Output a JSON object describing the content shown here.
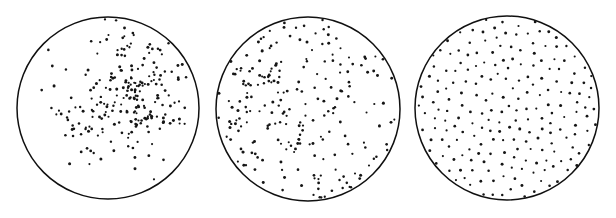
{
  "figure": {
    "width": 616,
    "height": 218,
    "background_color": "#ffffff",
    "ink_color": "#151515",
    "circle_stroke_color": "#101010",
    "circle_stroke_width": 1.5,
    "dot_color": "#151515",
    "dot_radius": 1.25,
    "panel_count": 3
  },
  "chart_data": {
    "type": "scatter",
    "title": "",
    "subtitle": "",
    "xlabel": "",
    "ylabel": "",
    "grid": false,
    "legend": "none",
    "axes_visible": false,
    "window_shape": "circle",
    "panels": [
      {
        "index": 0,
        "name": "clustered",
        "label": "",
        "center_x": 108,
        "center_y": 108,
        "radius": 91,
        "n_points": 232,
        "pattern": "clustered",
        "seed": 20731,
        "params": {
          "n_parents": 14,
          "cluster_sigma_frac": 0.2,
          "cluster_center_x_frac": 0.08,
          "cluster_center_y_frac": 0.02,
          "cluster_spread_frac": 0.3,
          "background_fraction": 0.16,
          "inhibition_frac": 0.0
        }
      },
      {
        "index": 1,
        "name": "random",
        "label": "",
        "center_x": 308,
        "center_y": 109,
        "radius": 92,
        "n_points": 228,
        "pattern": "random",
        "seed": 48219,
        "params": {
          "n_parents": 0,
          "cluster_sigma_frac": 0.0,
          "cluster_center_x_frac": 0.0,
          "cluster_center_y_frac": 0.0,
          "cluster_spread_frac": 0.0,
          "background_fraction": 1.0,
          "inhibition_frac": 0.0
        }
      },
      {
        "index": 2,
        "name": "regular",
        "label": "",
        "center_x": 507,
        "center_y": 108,
        "radius": 92,
        "n_points": 208,
        "pattern": "regular",
        "seed": 91137,
        "params": {
          "n_parents": 0,
          "cluster_sigma_frac": 0.0,
          "cluster_center_x_frac": 0.0,
          "cluster_center_y_frac": 0.0,
          "cluster_spread_frac": 0.0,
          "background_fraction": 1.0,
          "inhibition_frac": 0.047
        }
      }
    ]
  }
}
